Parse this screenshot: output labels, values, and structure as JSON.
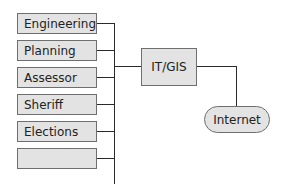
{
  "diagram": {
    "departments": [
      {
        "label": "Engineering"
      },
      {
        "label": "Planning"
      },
      {
        "label": "Assessor"
      },
      {
        "label": "Sheriff"
      },
      {
        "label": "Elections"
      },
      {
        "label": ""
      }
    ],
    "hub": {
      "label": "IT/GIS"
    },
    "external": {
      "label": "Internet"
    },
    "colors": {
      "box_fill": "#e3e3e3",
      "border": "#6e6e6e",
      "line": "#2a2a2a"
    }
  }
}
